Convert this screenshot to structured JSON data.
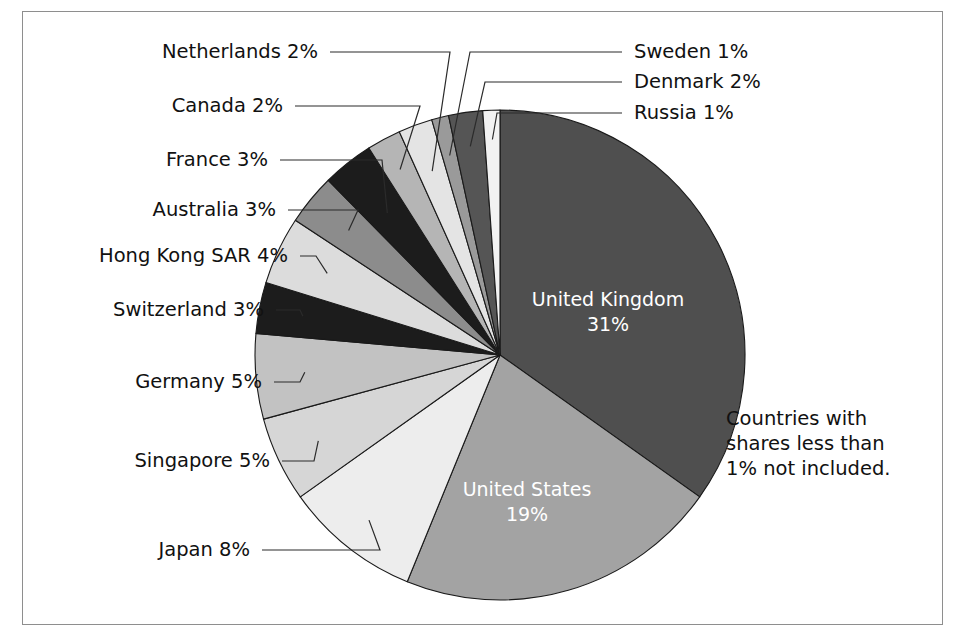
{
  "figure": {
    "background_color": "#ffffff",
    "frame_color": "#8e8e8e",
    "note": {
      "lines": [
        "Countries with",
        "shares less than",
        "1% not included."
      ]
    }
  },
  "chart_data": {
    "type": "pie",
    "title": "",
    "xlabel": "",
    "ylabel": "",
    "units": "percent",
    "start_angle_deg": 0,
    "direction": "clockwise",
    "legend_position": "none",
    "grid": false,
    "note": "Countries with shares less than 1% not included.",
    "categories": [
      "United Kingdom",
      "United States",
      "Japan",
      "Singapore",
      "Germany",
      "Switzerland",
      "Hong Kong SAR",
      "Australia",
      "France",
      "Canada",
      "Netherlands",
      "Sweden",
      "Denmark",
      "Russia"
    ],
    "values": [
      31,
      19,
      8,
      5,
      5,
      3,
      4,
      3,
      3,
      2,
      2,
      1,
      2,
      1
    ],
    "labels": [
      "United Kingdom 31%",
      "United States 19%",
      "Japan 8%",
      "Singapore 5%",
      "Germany 5%",
      "Switzerland 3%",
      "Hong Kong SAR 4%",
      "Australia 3%",
      "France 3%",
      "Canada 2%",
      "Netherlands 2%",
      "Sweden 1%",
      "Denmark 2%",
      "Russia 1%"
    ],
    "colors": [
      "#4f4f4f",
      "#a3a3a3",
      "#ededed",
      "#d6d6d6",
      "#c2c2c2",
      "#1c1c1c",
      "#dcdcdc",
      "#8c8c8c",
      "#1c1c1c",
      "#b5b5b5",
      "#e4e4e4",
      "#9a9a9a",
      "#555555",
      "#f2f2f2"
    ]
  },
  "inner_labels": [
    {
      "name": "united-kingdom",
      "line1": "United Kingdom",
      "line2": "31%"
    },
    {
      "name": "united-states",
      "line1": "United States",
      "line2": "19%"
    }
  ],
  "callouts": [
    {
      "name": "netherlands",
      "text": "Netherlands 2%",
      "side": "left"
    },
    {
      "name": "canada",
      "text": "Canada 2%",
      "side": "left"
    },
    {
      "name": "france",
      "text": "France 3%",
      "side": "left"
    },
    {
      "name": "australia",
      "text": "Australia 3%",
      "side": "left"
    },
    {
      "name": "hong-kong-sar",
      "text": "Hong Kong SAR 4%",
      "side": "left"
    },
    {
      "name": "switzerland",
      "text": "Switzerland 3%",
      "side": "left"
    },
    {
      "name": "germany",
      "text": "Germany 5%",
      "side": "left"
    },
    {
      "name": "singapore",
      "text": "Singapore 5%",
      "side": "left"
    },
    {
      "name": "japan",
      "text": "Japan 8%",
      "side": "left"
    },
    {
      "name": "sweden",
      "text": "Sweden 1%",
      "side": "right"
    },
    {
      "name": "denmark",
      "text": "Denmark 2%",
      "side": "right"
    },
    {
      "name": "russia",
      "text": "Russia 1%",
      "side": "right"
    }
  ]
}
